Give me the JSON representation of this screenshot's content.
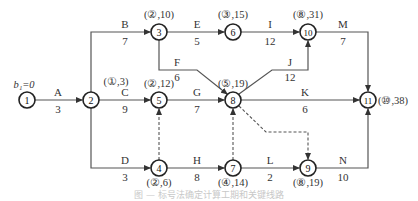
{
  "figure": {
    "start_label": "b₁=0",
    "caption": "图 — 标号法确定计算工期和关键线路"
  },
  "nodes": [
    {
      "id": "1",
      "x": 27,
      "y": 100,
      "label": ""
    },
    {
      "id": "2",
      "x": 91,
      "y": 100,
      "label": "(①,3)"
    },
    {
      "id": "3",
      "x": 159,
      "y": 32,
      "label": "(②,10)"
    },
    {
      "id": "4",
      "x": 159,
      "y": 168,
      "label": "(②,6)"
    },
    {
      "id": "5",
      "x": 159,
      "y": 100,
      "label": "(②,12)"
    },
    {
      "id": "6",
      "x": 233,
      "y": 32,
      "label": "(③,15)"
    },
    {
      "id": "7",
      "x": 233,
      "y": 168,
      "label": "(④,14)"
    },
    {
      "id": "8",
      "x": 233,
      "y": 100,
      "label": "(⑤,19)"
    },
    {
      "id": "9",
      "x": 308,
      "y": 168,
      "label": "(⑧,19)"
    },
    {
      "id": "10",
      "x": 308,
      "y": 32,
      "label": "(⑧,31)"
    },
    {
      "id": "11",
      "x": 368,
      "y": 100,
      "label": "(⑩,38)"
    }
  ],
  "activities": [
    {
      "name": "A",
      "duration": "3",
      "from": "1",
      "to": "2"
    },
    {
      "name": "B",
      "duration": "7",
      "from": "2",
      "to": "3"
    },
    {
      "name": "C",
      "duration": "9",
      "from": "2",
      "to": "5"
    },
    {
      "name": "D",
      "duration": "3",
      "from": "2",
      "to": "4"
    },
    {
      "name": "E",
      "duration": "5",
      "from": "3",
      "to": "6"
    },
    {
      "name": "F",
      "duration": "6",
      "from": "3",
      "to": "8"
    },
    {
      "name": "G",
      "duration": "7",
      "from": "5",
      "to": "8"
    },
    {
      "name": "H",
      "duration": "8",
      "from": "4",
      "to": "7"
    },
    {
      "name": "I",
      "duration": "12",
      "from": "6",
      "to": "10"
    },
    {
      "name": "J",
      "duration": "12",
      "from": "8",
      "to": "10"
    },
    {
      "name": "K",
      "duration": "6",
      "from": "8",
      "to": "11"
    },
    {
      "name": "L",
      "duration": "2",
      "from": "7",
      "to": "9"
    },
    {
      "name": "M",
      "duration": "7",
      "from": "10",
      "to": "11"
    },
    {
      "name": "N",
      "duration": "10",
      "from": "9",
      "to": "11"
    }
  ],
  "dummies": [
    {
      "from": "4",
      "to": "5"
    },
    {
      "from": "7",
      "to": "8"
    },
    {
      "from": "8",
      "to": "9"
    }
  ]
}
